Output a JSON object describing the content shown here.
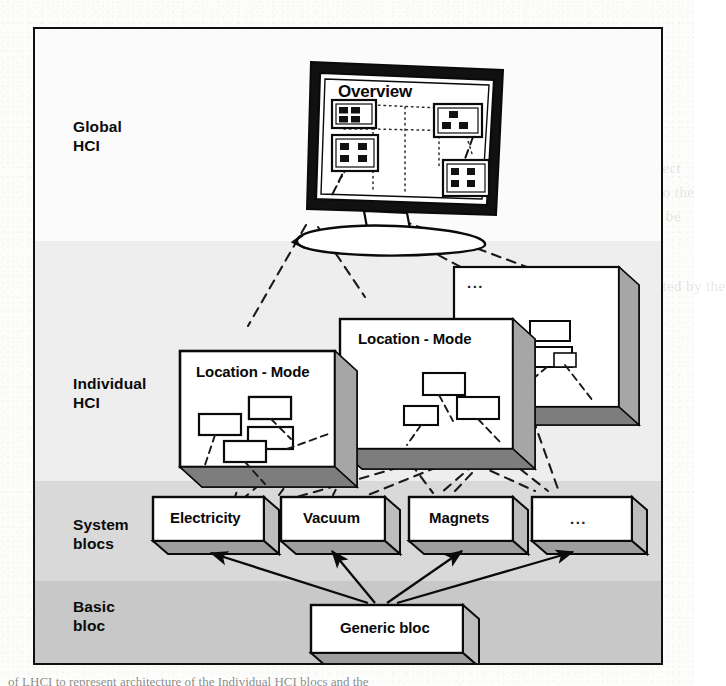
{
  "figure": {
    "caption": "of LHCI to represent architecture of the Individual HCI blocs and the"
  },
  "layers": [
    {
      "id": "global",
      "label": "Global\nHCI",
      "band_color": "#fbfbfb"
    },
    {
      "id": "individual",
      "label": "Individual\nHCI",
      "band_color": "#eeeeee"
    },
    {
      "id": "system",
      "label": "System\nblocs",
      "band_color": "#d9d9d9"
    },
    {
      "id": "basic",
      "label": "Basic\nbloc",
      "band_color": "#c8c8c8"
    }
  ],
  "global_layer": {
    "monitor": {
      "screen_title": "Overview",
      "mini_windows": [
        {
          "id": "mw-1",
          "cells": 3
        },
        {
          "id": "mw-2",
          "cells": 4
        },
        {
          "id": "mw-3",
          "cells": 4
        },
        {
          "id": "mw-4",
          "cells": 4
        }
      ]
    }
  },
  "individual_layer": {
    "panels": [
      {
        "id": "panel-front",
        "title": "Location - Mode",
        "widgets": 4
      },
      {
        "id": "panel-middle",
        "title": "Location - Mode",
        "widgets": 4
      },
      {
        "id": "panel-back",
        "title": "...",
        "widgets": 3
      }
    ]
  },
  "system_layer": {
    "blocs": [
      {
        "id": "bloc-electricity",
        "label": "Electricity"
      },
      {
        "id": "bloc-vacuum",
        "label": "Vacuum"
      },
      {
        "id": "bloc-magnets",
        "label": "Magnets"
      },
      {
        "id": "bloc-more",
        "label": "..."
      }
    ]
  },
  "basic_layer": {
    "bloc": {
      "id": "bloc-generic",
      "label": "Generic bloc"
    }
  },
  "ghost_text": [
    {
      "text": "of  HCI  on  the  top  part  of  the  figure",
      "x": 404,
      "y": 88
    },
    {
      "text": "tions  and  are  represented  as  the",
      "x": 404,
      "y": 112
    },
    {
      "text": "This  allows  the  definition  of  the  generic",
      "x": 404,
      "y": 136
    },
    {
      "text": "blocs.  Each  of  them  is  related  to  one  aspect",
      "x": 404,
      "y": 160
    },
    {
      "text": "combination  of  these  is  a  style  relevant  to  the",
      "x": 404,
      "y": 184
    },
    {
      "text": "constraints  of  the  system  and  is  a  link  to  be",
      "x": 404,
      "y": 208
    },
    {
      "text": "configured  for  the  specific  instance",
      "x": 404,
      "y": 254
    },
    {
      "text": "Generic  blocs  are  inherited  and  instantiated  by  the",
      "x": 404,
      "y": 278
    },
    {
      "text": "system  blocs.",
      "x": 404,
      "y": 302
    },
    {
      "text": "and  the  set  of  basic  blocs  that  can",
      "x": 404,
      "y": 396
    },
    {
      "text": "be  composed  to  build  more  complex",
      "x": 404,
      "y": 420
    },
    {
      "text": "structures  for  the  application",
      "x": 404,
      "y": 444
    },
    {
      "text": "interaction  model",
      "x": 404,
      "y": 468
    }
  ],
  "colors": {
    "ink": "#0a0a0a",
    "box_fill": "#ffffff",
    "box_side": "#9a9a9a",
    "dashed_link": "#1a1a1a",
    "arrow": "#0a0a0a"
  }
}
